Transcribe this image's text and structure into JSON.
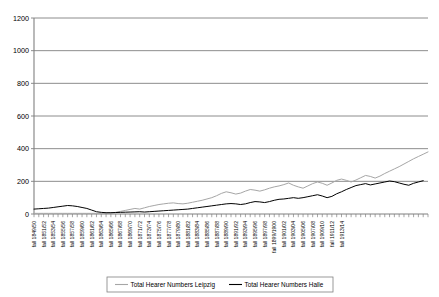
{
  "chart_data": {
    "type": "line",
    "title": "",
    "xlabel": "",
    "ylabel": "",
    "ylim": [
      0,
      1200
    ],
    "ytick_step": 200,
    "yticks": [
      0,
      200,
      400,
      600,
      800,
      1000,
      1200
    ],
    "grid": true,
    "legend_position": "bottom",
    "x_tick_label_rotation": 90,
    "x_label_every": 2,
    "colors": {
      "leipzig": "#a6a6a6",
      "halle": "#000000",
      "gridline": "#808080",
      "axis": "#808080",
      "plot_background": "#ffffff",
      "legend_border": "#808080"
    },
    "x": [
      "fall 1849/50",
      "fall 1850/51",
      "fall 1851/52",
      "fall 1852/53",
      "fall 1853/54",
      "fall 1854/55",
      "fall 1855/56",
      "fall 1856/57",
      "fall 1857/58",
      "fall 1858/59",
      "fall 1859/60",
      "fall 1860/61",
      "fall 1861/62",
      "fall 1862/63",
      "fall 1863/64",
      "fall 1864/65",
      "fall 1865/66",
      "fall 1866/67",
      "fall 1867/68",
      "fall 1868/69",
      "fall 1869/70",
      "fall 1870/71",
      "fall 1871/72",
      "fall 1872/73",
      "fall 1873/74",
      "fall 1874/75",
      "fall 1875/76",
      "fall 1876/77",
      "fall 1877/78",
      "fall 1878/79",
      "fall 1879/80",
      "fall 1880/81",
      "fall 1881/82",
      "fall 1882/83",
      "fall 1883/84",
      "fall 1884/85",
      "fall 1885/86",
      "fall 1886/87",
      "fall 1887/88",
      "fall 1888/89",
      "fall 1889/90",
      "fall 1890/91",
      "fall 1891/92",
      "fall 1892/93",
      "fall 1893/94",
      "fall 1894/95",
      "fall 1895/96",
      "fall 1896/97",
      "fall 1897/98",
      "fall 1898/99",
      "fall 1899/1900",
      "fall 1900/01",
      "fall 1901/02",
      "fall 1902/03",
      "fall 1903/04",
      "fall 1904/05",
      "fall 1905/06",
      "fall 1906/07",
      "fall 1907/08",
      "fall 1908/09",
      "fall 1909/10",
      "fall 1910/11",
      "fall 1911/12",
      "fall 1912/13",
      "fall 1913/14",
      "fall 1914/15"
    ],
    "xtick_labels_shown": [
      "fall 1849/50",
      "fall 1851/52",
      "fall 1853/54",
      "fall 1855/56",
      "fall 1857/58",
      "fall 1859/60",
      "fall 1861/62",
      "fall 1863/64",
      "fall 1865/66",
      "fall 1867/68",
      "fall 1869/70",
      "fall 1871/72",
      "fall 1873/74",
      "fall 1875/76",
      "fall 1877/78",
      "fall 1879/80",
      "fall 1881/82",
      "fall 1883/84",
      "fall 1885/86",
      "fall 1887/88",
      "fall 1889/90",
      "fall 1891/92",
      "fall 1893/94",
      "fall 1895/96",
      "fall 1897/98",
      "fall 1899/1900",
      "fall 1901/02",
      "fall 1903/04",
      "fall 1905/06",
      "fall 1907/08",
      "fall 1909/10",
      "fall 1911/12",
      "fall 1913/14"
    ],
    "series": [
      {
        "name": "Total Hearer Numbers Leipzig",
        "color": "#a6a6a6",
        "values": [
          6,
          6,
          5,
          6,
          6,
          5,
          6,
          7,
          8,
          9,
          10,
          12,
          14,
          16,
          18,
          20,
          24,
          28,
          33,
          38,
          44,
          40,
          52,
          60,
          66,
          70,
          74,
          76,
          72,
          70,
          74,
          80,
          86,
          92,
          100,
          112,
          126,
          136,
          130,
          122,
          128,
          140,
          150,
          146,
          140,
          148,
          158,
          166,
          172,
          180,
          190,
          176,
          330,
          316,
          300,
          312,
          286,
          246,
          330,
          508,
          566,
          600,
          626,
          640,
          618,
          636
        ]
      },
      {
        "name": "Total Hearer Numbers Halle",
        "color": "#000000",
        "values": [
          32,
          33,
          34,
          36,
          38,
          40,
          44,
          50,
          52,
          48,
          42,
          36,
          20,
          10,
          8,
          9,
          10,
          11,
          12,
          13,
          14,
          12,
          16,
          18,
          20,
          22,
          24,
          26,
          28,
          30,
          34,
          38,
          42,
          46,
          50,
          54,
          60,
          64,
          62,
          58,
          62,
          70,
          76,
          74,
          70,
          76,
          84,
          90,
          92,
          96,
          100,
          96,
          120,
          116,
          112,
          118,
          110,
          100,
          124,
          150,
          162,
          174,
          180,
          186,
          178,
          184
        ]
      }
    ],
    "series_full": {
      "leipzig": [
        4,
        4,
        4,
        4,
        4,
        4,
        4,
        4,
        4,
        4,
        4,
        4,
        4,
        4,
        4,
        4,
        6,
        10,
        16,
        22,
        28,
        34,
        30,
        38,
        46,
        52,
        58,
        62,
        66,
        68,
        64,
        62,
        66,
        72,
        78,
        84,
        92,
        100,
        112,
        126,
        136,
        130,
        122,
        128,
        140,
        150,
        146,
        140,
        148,
        158,
        166,
        172,
        180,
        190,
        176,
        166,
        158,
        172,
        186,
        196,
        188,
        176,
        190,
        206,
        214,
        206,
        196,
        208,
        222,
        236,
        230,
        220,
        232,
        248,
        262,
        276,
        290,
        306,
        322,
        338,
        352,
        366,
        380
      ],
      "halle": [
        30,
        32,
        34,
        36,
        40,
        44,
        48,
        52,
        50,
        46,
        40,
        34,
        24,
        14,
        10,
        8,
        8,
        9,
        10,
        11,
        12,
        13,
        14,
        12,
        14,
        16,
        18,
        20,
        22,
        24,
        26,
        28,
        30,
        34,
        38,
        42,
        46,
        50,
        54,
        58,
        62,
        64,
        62,
        58,
        62,
        70,
        76,
        74,
        70,
        76,
        84,
        90,
        92,
        96,
        100,
        96,
        100,
        106,
        112,
        118,
        110,
        100,
        108,
        124,
        136,
        150,
        162,
        174,
        180,
        186,
        178,
        184,
        190,
        196,
        202,
        198,
        190,
        182,
        176,
        188,
        196,
        204
      ]
    },
    "notes": {
      "leipzig_peak_value": 950,
      "leipzig_peak_period": "fall 1911/12",
      "halle_peak_value": 280,
      "halle_typical_late": 200,
      "both_series_drop_at_end": true,
      "end_drop_period": "fall 1913/14"
    }
  },
  "legend": {
    "items": [
      {
        "label": "Total Hearer Numbers Leipzig"
      },
      {
        "label": "Total Hearer Numbers Halle"
      }
    ]
  }
}
